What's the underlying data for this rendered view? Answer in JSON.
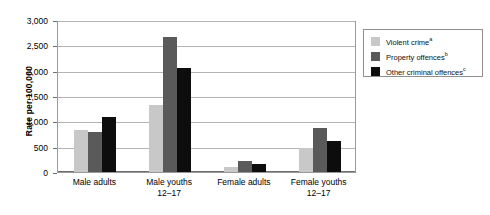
{
  "chart_data": {
    "type": "bar",
    "title": "",
    "xlabel": "",
    "ylabel": "Rate per 100,000",
    "ylim": [
      0,
      3000
    ],
    "ytick_labels": [
      "0",
      "500",
      "1,000",
      "1,500",
      "2,000",
      "2,500",
      "3,000"
    ],
    "ytick_values": [
      0,
      500,
      1000,
      1500,
      2000,
      2500,
      3000
    ],
    "grid": true,
    "legend_position": "right",
    "categories": [
      "Male adults",
      "Male youths 12–17",
      "Female adults",
      "Female youths 12–17"
    ],
    "category_lines": [
      {
        "line1": "Male adults",
        "line2": ""
      },
      {
        "line1": "Male youths",
        "line2": "12–17"
      },
      {
        "line1": "Female adults",
        "line2": ""
      },
      {
        "line1": "Female youths",
        "line2": "12–17"
      }
    ],
    "series": [
      {
        "name": "Violent crime",
        "footnote": "a",
        "color": "#c8c8c8",
        "values": [
          830,
          1330,
          90,
          470
        ]
      },
      {
        "name": "Property offences",
        "footnote": "b",
        "color": "#5a5a5a",
        "values": [
          800,
          2680,
          210,
          880
        ]
      },
      {
        "name": "Other criminal offences",
        "footnote": "c",
        "color": "#0d0d0d",
        "values": [
          1090,
          2060,
          150,
          610
        ]
      }
    ]
  },
  "legend": {
    "items": [
      {
        "label": "Violent crime",
        "footnote": "a"
      },
      {
        "label": "Property offences",
        "footnote": "b"
      },
      {
        "label": "Other criminal offences",
        "footnote": "c"
      }
    ]
  },
  "colors": {
    "series_light": "#c8c8c8",
    "series_medium": "#5a5a5a",
    "series_dark": "#0d0d0d",
    "gridline": "#b4b4b4",
    "axis": "#6e6e6e",
    "frame": "#9a9a9a"
  }
}
